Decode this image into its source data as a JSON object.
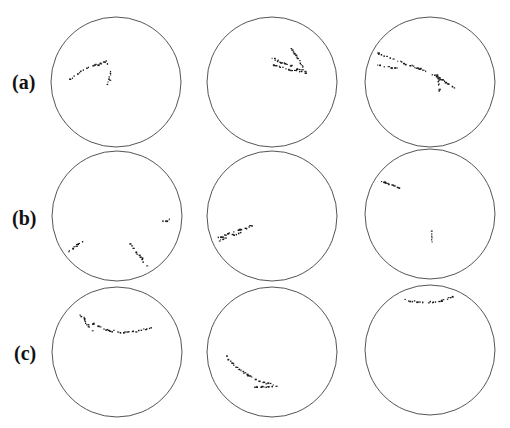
{
  "figure": {
    "row_labels": [
      {
        "text": "(a)",
        "x": 12,
        "y": 71
      },
      {
        "text": "(b)",
        "x": 12,
        "y": 207
      },
      {
        "text": "(c)",
        "x": 14,
        "y": 342
      }
    ],
    "circle_stroke": "#555555",
    "trace_color": "#1a1a1a",
    "panels": [
      {
        "row": "a",
        "col": 1,
        "cx": 116,
        "cy": 82,
        "r": 65,
        "traces": [
          [
            [
              69,
              79
            ],
            [
              80,
              71
            ],
            [
              92,
              65
            ],
            [
              100,
              63
            ],
            [
              106,
              61
            ],
            [
              108,
              67
            ],
            [
              110,
              72
            ],
            [
              109,
              78
            ],
            [
              107,
              85
            ]
          ]
        ]
      },
      {
        "row": "a",
        "col": 2,
        "cx": 272,
        "cy": 82,
        "r": 65,
        "traces": [
          [
            [
              290,
              48
            ],
            [
              296,
              56
            ],
            [
              300,
              62
            ],
            [
              303,
              68
            ],
            [
              305,
              72
            ]
          ],
          [
            [
              272,
              58
            ],
            [
              282,
              62
            ],
            [
              292,
              66
            ],
            [
              302,
              70
            ],
            [
              306,
              73
            ]
          ],
          [
            [
              269,
              63
            ],
            [
              280,
              67
            ],
            [
              292,
              70
            ],
            [
              302,
              72
            ]
          ]
        ]
      },
      {
        "row": "a",
        "col": 3,
        "cx": 430,
        "cy": 82,
        "r": 65,
        "traces": [
          [
            [
              377,
              53
            ],
            [
              388,
              57
            ],
            [
              398,
              61
            ],
            [
              408,
              64
            ],
            [
              418,
              68
            ],
            [
              428,
              72
            ],
            [
              436,
              76
            ],
            [
              442,
              80
            ],
            [
              448,
              84
            ],
            [
              458,
              89
            ]
          ],
          [
            [
              376,
              64
            ],
            [
              386,
              66
            ],
            [
              398,
              68
            ]
          ],
          [
            [
              436,
              74
            ],
            [
              438,
              81
            ],
            [
              439,
              88
            ],
            [
              439,
              91
            ]
          ]
        ]
      },
      {
        "row": "b",
        "col": 1,
        "cx": 117,
        "cy": 216,
        "r": 65,
        "traces": [
          [
            [
              68,
              251
            ],
            [
              74,
              246
            ],
            [
              79,
              243
            ],
            [
              83,
              240
            ]
          ],
          [
            [
              130,
              243
            ],
            [
              135,
              251
            ],
            [
              140,
              257
            ],
            [
              145,
              263
            ],
            [
              148,
              267
            ]
          ],
          [
            [
              163,
              220
            ],
            [
              170,
              219
            ]
          ]
        ]
      },
      {
        "row": "b",
        "col": 2,
        "cx": 272,
        "cy": 216,
        "r": 65,
        "traces": [
          [
            [
              217,
              238
            ],
            [
              225,
              234
            ],
            [
              235,
              230
            ],
            [
              245,
              227
            ],
            [
              253,
              224
            ]
          ],
          [
            [
              219,
              240
            ],
            [
              228,
              236
            ],
            [
              238,
              232
            ],
            [
              248,
              228
            ]
          ]
        ]
      },
      {
        "row": "b",
        "col": 3,
        "cx": 430,
        "cy": 214,
        "r": 65,
        "traces": [
          [
            [
              381,
              181
            ],
            [
              388,
              183
            ],
            [
              394,
              185
            ],
            [
              399,
              188
            ]
          ],
          [
            [
              430,
              231
            ],
            [
              431,
              237
            ],
            [
              432,
              243
            ]
          ]
        ]
      },
      {
        "row": "c",
        "col": 1,
        "cx": 117,
        "cy": 352,
        "r": 65,
        "traces": [
          [
            [
              77,
              313
            ],
            [
              87,
              320
            ],
            [
              97,
              326
            ],
            [
              110,
              330
            ],
            [
              125,
              332
            ],
            [
              138,
              330
            ],
            [
              152,
              327
            ]
          ],
          [
            [
              83,
              318
            ],
            [
              89,
              327
            ],
            [
              94,
              332
            ]
          ]
        ]
      },
      {
        "row": "c",
        "col": 2,
        "cx": 272,
        "cy": 352,
        "r": 65,
        "traces": [
          [
            [
              226,
              356
            ],
            [
              233,
              365
            ],
            [
              242,
              371
            ],
            [
              252,
              377
            ],
            [
              262,
              382
            ],
            [
              274,
              384
            ]
          ],
          [
            [
              252,
              387
            ],
            [
              262,
              386
            ],
            [
              278,
              385
            ]
          ]
        ]
      },
      {
        "row": "c",
        "col": 3,
        "cx": 430,
        "cy": 350,
        "r": 65,
        "traces": [
          [
            [
              405,
              299
            ],
            [
              415,
              301
            ],
            [
              425,
              302
            ],
            [
              435,
              301
            ],
            [
              445,
              299
            ],
            [
              453,
              296
            ]
          ]
        ]
      }
    ]
  }
}
